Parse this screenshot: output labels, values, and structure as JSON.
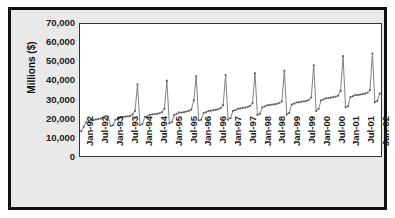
{
  "chart_data": {
    "type": "line",
    "title": "",
    "xlabel": "",
    "ylabel": "Millions ($)",
    "ylim": [
      0,
      70000
    ],
    "ytick_labels": [
      "70,000",
      "60,000",
      "50,000",
      "40,000",
      "30,000",
      "20,000",
      "10,000",
      "0"
    ],
    "ytick_values": [
      70000,
      60000,
      50000,
      40000,
      30000,
      20000,
      10000,
      0
    ],
    "grid": false,
    "legend": "none",
    "marker": "square",
    "line_color": "#808080",
    "marker_color": "#595959",
    "xtick_labels": [
      "Jan-92",
      "Jul-92",
      "Jan-93",
      "Jul-93",
      "Jan-94",
      "Jul-94",
      "Jan-95",
      "Jul-95",
      "Jan-96",
      "Jul-96",
      "Jan-97",
      "Jul-97",
      "Jan-98",
      "Jul-98",
      "Jan-99",
      "Jul-99",
      "Jan-00",
      "Jul-00",
      "Jan-01",
      "Jul-01",
      "Jan-02"
    ],
    "x": [
      "Jan-92",
      "Feb-92",
      "Mar-92",
      "Apr-92",
      "May-92",
      "Jun-92",
      "Jul-92",
      "Aug-92",
      "Sep-92",
      "Oct-92",
      "Nov-92",
      "Dec-92",
      "Jan-93",
      "Feb-93",
      "Mar-93",
      "Apr-93",
      "May-93",
      "Jun-93",
      "Jul-93",
      "Aug-93",
      "Sep-93",
      "Oct-93",
      "Nov-93",
      "Dec-93",
      "Jan-94",
      "Feb-94",
      "Mar-94",
      "Apr-94",
      "May-94",
      "Jun-94",
      "Jul-94",
      "Aug-94",
      "Sep-94",
      "Oct-94",
      "Nov-94",
      "Dec-94",
      "Jan-95",
      "Feb-95",
      "Mar-95",
      "Apr-95",
      "May-95",
      "Jun-95",
      "Jul-95",
      "Aug-95",
      "Sep-95",
      "Oct-95",
      "Nov-95",
      "Dec-95",
      "Jan-96",
      "Feb-96",
      "Mar-96",
      "Apr-96",
      "May-96",
      "Jun-96",
      "Jul-96",
      "Aug-96",
      "Sep-96",
      "Oct-96",
      "Nov-96",
      "Dec-96",
      "Jan-97",
      "Feb-97",
      "Mar-97",
      "Apr-97",
      "May-97",
      "Jun-97",
      "Jul-97",
      "Aug-97",
      "Sep-97",
      "Oct-97",
      "Nov-97",
      "Dec-97",
      "Jan-98",
      "Feb-98",
      "Mar-98",
      "Apr-98",
      "May-98",
      "Jun-98",
      "Jul-98",
      "Aug-98",
      "Sep-98",
      "Oct-98",
      "Nov-98",
      "Dec-98",
      "Jan-99",
      "Feb-99",
      "Mar-99",
      "Apr-99",
      "May-99",
      "Jun-99",
      "Jul-99",
      "Aug-99",
      "Sep-99",
      "Oct-99",
      "Nov-99",
      "Dec-99",
      "Jan-00",
      "Feb-00",
      "Mar-00",
      "Apr-00",
      "May-00",
      "Jun-00",
      "Jul-00",
      "Aug-00",
      "Sep-00",
      "Oct-00",
      "Nov-00",
      "Dec-00",
      "Jan-01",
      "Feb-01",
      "Mar-01",
      "Apr-01",
      "May-01",
      "Jun-01",
      "Jul-01",
      "Aug-01",
      "Sep-01",
      "Oct-01",
      "Nov-01",
      "Dec-01",
      "Jan-02",
      "Feb-02",
      "Mar-02"
    ],
    "values": [
      13200,
      15500,
      17800,
      18400,
      19300,
      19000,
      19400,
      19600,
      19900,
      20400,
      21300,
      20900,
      16000,
      16300,
      19300,
      19800,
      20600,
      20700,
      20900,
      21000,
      21300,
      22000,
      24000,
      38000,
      16400,
      17000,
      20800,
      21000,
      21800,
      22100,
      22200,
      22400,
      22700,
      23200,
      25000,
      40000,
      17300,
      18000,
      21800,
      22400,
      23100,
      23000,
      23300,
      23600,
      24000,
      24600,
      29500,
      42300,
      18900,
      19200,
      22800,
      23200,
      23900,
      24000,
      24300,
      24500,
      24800,
      25400,
      27000,
      42900,
      19300,
      20100,
      23900,
      24300,
      25100,
      25200,
      25500,
      25700,
      26000,
      26600,
      28000,
      43900,
      21800,
      22400,
      25800,
      26300,
      26900,
      27000,
      27300,
      27400,
      27700,
      28200,
      29000,
      45300,
      22000,
      22800,
      27300,
      27800,
      28400,
      28500,
      28800,
      29000,
      29200,
      29800,
      31000,
      48100,
      23800,
      25000,
      29500,
      30000,
      30600,
      30700,
      31000,
      31200,
      31500,
      32000,
      34500,
      53000,
      25800,
      26400,
      31200,
      31700,
      32400,
      32300,
      32600,
      32800,
      33100,
      33600,
      35000,
      54400,
      28500,
      29200,
      33200
    ]
  }
}
